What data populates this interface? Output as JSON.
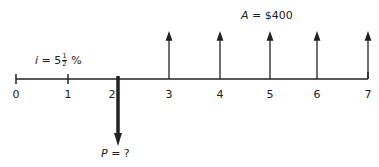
{
  "diagram": {
    "type": "cash-flow-diagram",
    "interest_label": {
      "symbol": "i",
      "eq": "=",
      "whole": "5",
      "num": "1",
      "den": "2",
      "unit": "%"
    },
    "annuity_label": {
      "symbol": "A",
      "eq": "=",
      "value": "$400"
    },
    "present_label": {
      "symbol": "P",
      "eq": "=",
      "value": "?"
    },
    "periods": [
      "0",
      "1",
      "2",
      "3",
      "4",
      "5",
      "6",
      "7"
    ],
    "up_arrows_at": [
      3,
      4,
      5,
      6,
      7
    ],
    "down_arrow_at": 2,
    "colors": {
      "line": "#222222",
      "background": "#ffffff"
    }
  }
}
